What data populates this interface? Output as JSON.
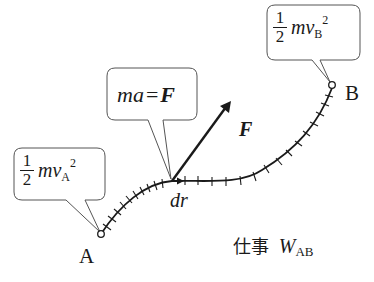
{
  "diagram": {
    "colors": {
      "stroke": "#1a1a1a",
      "background": "#ffffff",
      "box_border": "#555555"
    },
    "points": [
      {
        "id": "A",
        "label": "A"
      },
      {
        "id": "B",
        "label": "B"
      }
    ],
    "callouts": {
      "ke_A": {
        "frac_num": "1",
        "frac_den": "2",
        "expr": "mv",
        "sub": "A",
        "sup": "2"
      },
      "newton": {
        "lhs": "ma",
        "eq": "=",
        "rhs": "F"
      },
      "ke_B": {
        "frac_num": "1",
        "frac_den": "2",
        "expr": "mv",
        "sub": "B",
        "sup": "2"
      }
    },
    "vectors": {
      "force": {
        "label": "F"
      },
      "displacement": {
        "label": "dr"
      }
    },
    "work_label": {
      "kanji": "仕事",
      "symbol": "W",
      "sub": "AB"
    }
  }
}
